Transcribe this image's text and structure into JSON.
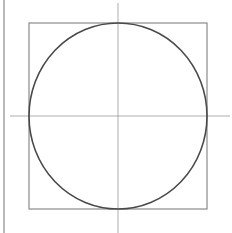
{
  "diagram": {
    "type": "geometric-construction",
    "colors": {
      "background": "#ffffff",
      "circle_stroke": "#4a4a4a",
      "square_stroke": "#8a8a8a",
      "crosshair_stroke": "#9a9a9a",
      "border_stroke": "#8a8a8a"
    },
    "left_border": {
      "x": 4,
      "y1": 0,
      "y2": 233
    },
    "square": {
      "x": 29,
      "y": 23,
      "width": 178,
      "height": 186
    },
    "circle": {
      "cx": 118,
      "cy": 116,
      "rx": 89,
      "ry": 93
    },
    "crosshair_horizontal": {
      "y": 116,
      "x1": 10,
      "x2": 230
    },
    "crosshair_vertical": {
      "x": 118,
      "y1": 3,
      "y2": 233
    }
  }
}
